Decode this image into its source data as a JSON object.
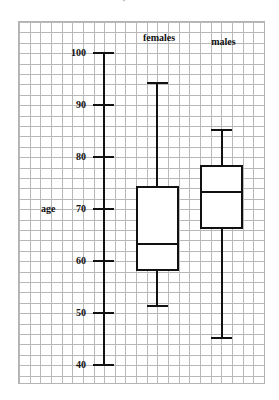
{
  "chart_data": {
    "type": "boxplot",
    "title": "",
    "ylabel": "age",
    "xlabel": "",
    "ylim": [
      40,
      100
    ],
    "y_ticks": [
      40,
      50,
      60,
      70,
      80,
      90,
      100
    ],
    "grid": true,
    "grid_spacing_units": 2,
    "categories": [
      "females",
      "males"
    ],
    "series": [
      {
        "name": "females",
        "min": 51,
        "q1": 58,
        "median": 63,
        "q3": 74,
        "max": 94
      },
      {
        "name": "males",
        "min": 45,
        "q1": 66,
        "median": 73,
        "q3": 78,
        "max": 85
      }
    ],
    "colors": {
      "stroke": "#111111",
      "grid": "#b8b8b8",
      "background": "#ffffff"
    }
  },
  "labels": {
    "ylabel": "age",
    "tick_labels": [
      "100",
      "90",
      "80",
      "70",
      "60",
      "50",
      "40"
    ],
    "categories": [
      "females",
      "males"
    ],
    "top_fragment": "·"
  }
}
